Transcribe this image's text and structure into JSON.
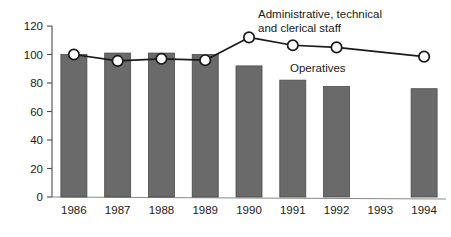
{
  "chart_data": {
    "type": "bar",
    "title": "",
    "xlabel": "",
    "ylabel": "",
    "ylim": [
      0,
      120
    ],
    "yticks": [
      0,
      20,
      40,
      60,
      80,
      100,
      120
    ],
    "grid": false,
    "legend_position": "inline-annotation",
    "categories": [
      "1986",
      "1987",
      "1988",
      "1989",
      "1990",
      "1991",
      "1992",
      "1993",
      "1994"
    ],
    "series": [
      {
        "name": "Operatives",
        "type": "bar",
        "color": "#6a6a6a",
        "values": [
          100,
          101,
          101,
          100,
          92,
          82,
          77.5,
          null,
          76
        ]
      },
      {
        "name": "Administrative, technical and clerical staff",
        "type": "line",
        "color": "#1a1a1a",
        "marker": "circle-open",
        "values": [
          100,
          95.5,
          97,
          96,
          112,
          106.5,
          105,
          null,
          98.5
        ]
      }
    ],
    "annotations": [
      {
        "name": "admin-series-label",
        "lines": [
          "Administrative, technical",
          "and clerical staff"
        ],
        "x": 258,
        "y": 18
      },
      {
        "name": "operatives-series-label",
        "lines": [
          "Operatives"
        ],
        "x": 290,
        "y": 72
      }
    ]
  },
  "axis": {
    "y_tick_labels": [
      "120",
      "100",
      "80",
      "60",
      "40",
      "20",
      "0"
    ],
    "x_tick_labels": [
      "1986",
      "1987",
      "1988",
      "1989",
      "1990",
      "1991",
      "1992",
      "1993",
      "1994"
    ]
  },
  "colors": {
    "bar_fill": "#6a6a6a",
    "bar_stroke": "#4a4a4a",
    "line": "#1a1a1a",
    "marker_fill": "#ffffff",
    "axis": "#4a4a4a",
    "background": "#ffffff"
  }
}
